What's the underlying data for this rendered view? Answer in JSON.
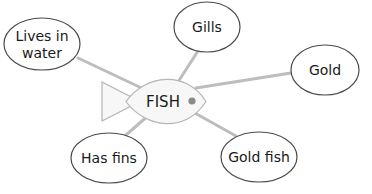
{
  "diagram": {
    "type": "mind-map",
    "center": {
      "label": "FISH",
      "shape": "fish"
    },
    "nodes": [
      {
        "id": "lives",
        "lines": [
          "Lives in",
          "water"
        ]
      },
      {
        "id": "gills",
        "lines": [
          "Gills"
        ]
      },
      {
        "id": "gold",
        "lines": [
          "Gold"
        ]
      },
      {
        "id": "fins",
        "lines": [
          "Has fins"
        ]
      },
      {
        "id": "goldfish",
        "lines": [
          "Gold fish"
        ]
      }
    ],
    "colors": {
      "link": "#bdbdbd",
      "bubble_stroke": "#4a4a4a",
      "fish_fill": "#f7f7f7",
      "fish_stroke": "#b5b5b5",
      "eye": "#8a8a8a"
    }
  }
}
